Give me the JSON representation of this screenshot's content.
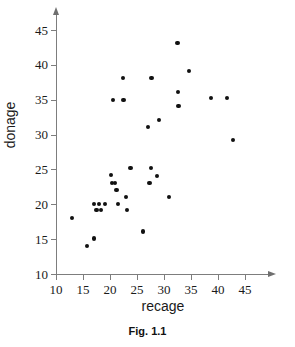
{
  "figure": {
    "caption": "Fig. 1.1"
  },
  "chart_data": {
    "type": "scatter",
    "title": "",
    "xlabel": "recage",
    "ylabel": "donage",
    "xlim": [
      10,
      47
    ],
    "ylim": [
      10,
      46.5
    ],
    "xticks": [
      10,
      15,
      20,
      25,
      30,
      35,
      40,
      45
    ],
    "yticks": [
      10,
      15,
      20,
      25,
      30,
      35,
      40,
      45
    ],
    "xticklabels": [
      "10",
      "15",
      "20",
      "25",
      "30",
      "35",
      "40",
      "45"
    ],
    "yticklabels": [
      "10",
      "15",
      "20",
      "25",
      "30",
      "35",
      "40",
      "45"
    ],
    "grid": false,
    "legend": null,
    "marker": "filled-circle",
    "marker_color": "#111111",
    "axis_color": "#7d7d7d",
    "points": [
      {
        "x": 13.0,
        "y": 18.0
      },
      {
        "x": 15.8,
        "y": 14.0
      },
      {
        "x": 17.0,
        "y": 15.1
      },
      {
        "x": 17.0,
        "y": 20.0
      },
      {
        "x": 17.5,
        "y": 19.2
      },
      {
        "x": 18.0,
        "y": 20.0
      },
      {
        "x": 18.4,
        "y": 19.2
      },
      {
        "x": 19.0,
        "y": 20.0
      },
      {
        "x": 20.2,
        "y": 24.2
      },
      {
        "x": 20.4,
        "y": 23.1
      },
      {
        "x": 20.6,
        "y": 35.0
      },
      {
        "x": 21.0,
        "y": 23.1
      },
      {
        "x": 21.2,
        "y": 22.1
      },
      {
        "x": 21.5,
        "y": 20.1
      },
      {
        "x": 22.4,
        "y": 38.1
      },
      {
        "x": 22.5,
        "y": 35.0
      },
      {
        "x": 23.0,
        "y": 21.1
      },
      {
        "x": 23.1,
        "y": 19.2
      },
      {
        "x": 23.8,
        "y": 25.2
      },
      {
        "x": 26.1,
        "y": 16.1
      },
      {
        "x": 27.0,
        "y": 31.1
      },
      {
        "x": 27.3,
        "y": 23.1
      },
      {
        "x": 27.6,
        "y": 25.2
      },
      {
        "x": 27.7,
        "y": 38.1
      },
      {
        "x": 28.7,
        "y": 24.1
      },
      {
        "x": 29.0,
        "y": 32.1
      },
      {
        "x": 30.9,
        "y": 21.1
      },
      {
        "x": 32.5,
        "y": 43.1
      },
      {
        "x": 32.6,
        "y": 36.1
      },
      {
        "x": 32.7,
        "y": 34.1
      },
      {
        "x": 34.6,
        "y": 39.1
      },
      {
        "x": 38.7,
        "y": 35.2
      },
      {
        "x": 41.6,
        "y": 35.2
      },
      {
        "x": 42.8,
        "y": 29.2
      }
    ]
  }
}
